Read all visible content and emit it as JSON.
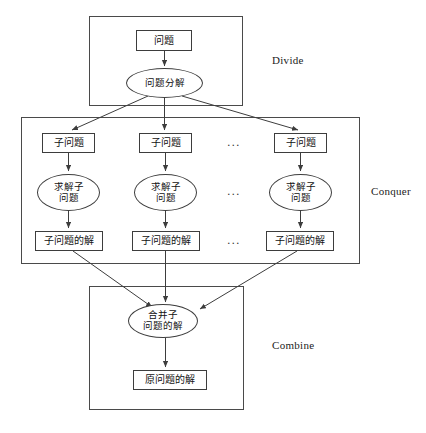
{
  "diagram": {
    "phases": [
      {
        "id": "divide",
        "label": "Divide",
        "box": {
          "x": 89,
          "y": 16,
          "w": 154,
          "h": 90
        },
        "label_pos": {
          "x": 272,
          "y": 54
        }
      },
      {
        "id": "conquer",
        "label": "Conquer",
        "box": {
          "x": 21,
          "y": 117,
          "w": 339,
          "h": 147
        },
        "label_pos": {
          "x": 371,
          "y": 185
        }
      },
      {
        "id": "combine",
        "label": "Combine",
        "box": {
          "x": 89,
          "y": 286,
          "w": 155,
          "h": 124
        },
        "label_pos": {
          "x": 272,
          "y": 339
        }
      }
    ],
    "nodes": [
      {
        "id": "problem",
        "shape": "box",
        "label": "问题",
        "x": 136,
        "y": 30,
        "w": 56,
        "h": 21
      },
      {
        "id": "decompose",
        "shape": "ellipse",
        "label": "问题分解",
        "x": 126,
        "y": 68,
        "w": 77,
        "h": 30
      },
      {
        "id": "sub1",
        "shape": "box",
        "label": "子问题",
        "x": 42,
        "y": 133,
        "w": 53,
        "h": 20
      },
      {
        "id": "sub2",
        "shape": "box",
        "label": "子问题",
        "x": 139,
        "y": 133,
        "w": 53,
        "h": 20
      },
      {
        "id": "subn",
        "shape": "box",
        "label": "子问题",
        "x": 274,
        "y": 133,
        "w": 53,
        "h": 20
      },
      {
        "id": "solve1",
        "shape": "ellipse",
        "label": "求解子\n问题",
        "x": 37,
        "y": 174,
        "w": 63,
        "h": 37
      },
      {
        "id": "solve2",
        "shape": "ellipse",
        "label": "求解子\n问题",
        "x": 134,
        "y": 174,
        "w": 63,
        "h": 37
      },
      {
        "id": "solven",
        "shape": "ellipse",
        "label": "求解子\n问题",
        "x": 269,
        "y": 174,
        "w": 63,
        "h": 37
      },
      {
        "id": "subsol1",
        "shape": "box",
        "label": "子问题的解",
        "x": 35,
        "y": 231,
        "w": 68,
        "h": 20
      },
      {
        "id": "subsol2",
        "shape": "box",
        "label": "子问题的解",
        "x": 132,
        "y": 231,
        "w": 68,
        "h": 20
      },
      {
        "id": "subsoln",
        "shape": "box",
        "label": "子问题的解",
        "x": 266,
        "y": 231,
        "w": 68,
        "h": 20
      },
      {
        "id": "merge",
        "shape": "ellipse",
        "label": "合并子\n问题的解",
        "x": 128,
        "y": 304,
        "w": 70,
        "h": 34
      },
      {
        "id": "finalsolution",
        "shape": "box",
        "label": "原问题的解",
        "x": 133,
        "y": 370,
        "w": 74,
        "h": 20
      }
    ],
    "ellipses_markers": [
      {
        "id": "dots-row-sub",
        "label": "...",
        "x": 227,
        "y": 136
      },
      {
        "id": "dots-row-solve",
        "label": "...",
        "x": 227,
        "y": 185
      },
      {
        "id": "dots-row-subsol",
        "label": "...",
        "x": 227,
        "y": 234
      }
    ],
    "colors": {
      "stroke": "#3d3d3d",
      "container_stroke": "#4a4a4a",
      "text": "#111111",
      "background": "#ffffff"
    }
  }
}
